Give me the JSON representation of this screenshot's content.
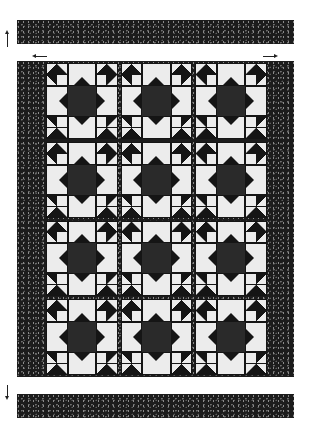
{
  "quilt": {
    "layout": {
      "block_columns": 3,
      "block_rows": 4
    },
    "colors": {
      "dark": "#151515",
      "light": "#ececec",
      "center": "#2a2a2a",
      "background": "#ffffff"
    },
    "parts": {
      "top_strip": "border-strip",
      "bottom_strip": "border-strip",
      "body": "star-block-grid"
    },
    "indicators": [
      "arrow-up",
      "arrow-down",
      "arrow-left",
      "arrow-right"
    ]
  }
}
